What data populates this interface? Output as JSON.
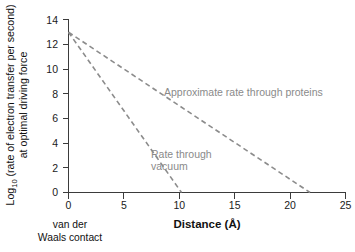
{
  "chart_data": {
    "type": "line",
    "title": "",
    "xlabel": "Distance (Å)",
    "ylabel_line1": "Log",
    "ylabel_sub": "10",
    "ylabel_line1_rest": " (rate of electron transfer per second)",
    "ylabel_line2": "at optimal driving force",
    "xlim": [
      0,
      25
    ],
    "ylim": [
      0,
      14
    ],
    "xticks": [
      0,
      5,
      10,
      15,
      20,
      25
    ],
    "yticks": [
      0,
      2,
      4,
      6,
      8,
      10,
      12,
      14
    ],
    "xtick_labels": [
      "0",
      "5",
      "10",
      "15",
      "20",
      "25"
    ],
    "ytick_labels": [
      "0",
      "2",
      "4",
      "6",
      "8",
      "10",
      "12",
      "14"
    ],
    "grid": false,
    "legend_position": "inline-annotations",
    "line_style": "dashed",
    "line_color": "#8c8c8c",
    "series": [
      {
        "name": "Approximate rate through proteins",
        "x": [
          0,
          21.8
        ],
        "values": [
          13,
          0
        ],
        "annotation": "Approximate rate through proteins"
      },
      {
        "name": "Rate through vacuum",
        "x": [
          0,
          10.2
        ],
        "values": [
          13,
          0
        ],
        "annotation_line1": "Rate through",
        "annotation_line2": "vacuum"
      }
    ],
    "annotations": [
      {
        "name": "van-der-waals-contact-note",
        "line1": "van der",
        "line2": "Waals contact",
        "at_x": 0
      }
    ]
  },
  "axis_color": "#3b3b3b",
  "text_color": "#111111",
  "annotation_color": "#8a8a8a"
}
